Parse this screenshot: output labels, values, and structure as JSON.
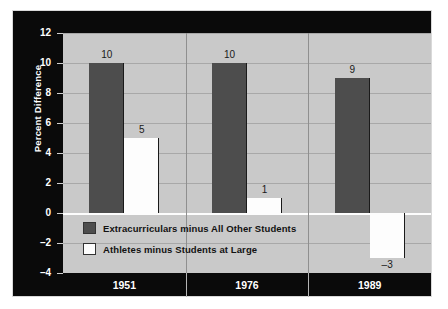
{
  "chart_data": {
    "type": "bar",
    "title": "",
    "subtitle": "",
    "xlabel": "",
    "ylabel": "Percent Difference",
    "ylim": [
      -4,
      12
    ],
    "yticks": [
      "12",
      "10",
      "8",
      "6",
      "4",
      "2",
      "0",
      "–2",
      "–4"
    ],
    "ytick_values": [
      12,
      10,
      8,
      6,
      4,
      2,
      0,
      -2,
      -4
    ],
    "grid": true,
    "legend_position": "inside-lower-left",
    "categories": [
      "1951",
      "1976",
      "1989"
    ],
    "series": [
      {
        "name": "Extracurriculars minus All Other Students",
        "color": "#4d4d4d",
        "values": [
          10,
          10,
          9
        ],
        "labels": [
          "10",
          "10",
          "9"
        ]
      },
      {
        "name": "Athletes minus Students at Large",
        "color": "#fdfdfd",
        "values": [
          5,
          1,
          -3
        ],
        "labels": [
          "5",
          "1",
          "–3"
        ]
      }
    ]
  },
  "axis": {
    "y_title": "Percent Difference",
    "y_ticks": [
      {
        "label": "12",
        "value": 12
      },
      {
        "label": "10",
        "value": 10
      },
      {
        "label": "8",
        "value": 8
      },
      {
        "label": "6",
        "value": 6
      },
      {
        "label": "4",
        "value": 4
      },
      {
        "label": "2",
        "value": 2
      },
      {
        "label": "0",
        "value": 0
      },
      {
        "label": "–2",
        "value": -2
      },
      {
        "label": "–4",
        "value": -4
      }
    ],
    "x_ticks": [
      {
        "label": "1951"
      },
      {
        "label": "1976"
      },
      {
        "label": "1989"
      }
    ]
  },
  "legend": {
    "items": [
      {
        "label": "Extracurriculars minus All Other Students",
        "swatch": "dark"
      },
      {
        "label": "Athletes minus Students at Large",
        "swatch": "light"
      }
    ]
  },
  "bar_labels": {
    "g1s1": "10",
    "g1s2": "5",
    "g2s1": "10",
    "g2s2": "1",
    "g3s1": "9",
    "g3s2": "–3"
  },
  "colors": {
    "panel_background": "#0a0a0a",
    "plot_background": "#c9c9c9",
    "gridline": "#a8a8a8",
    "zero_line": "#fdfdfd",
    "series_dark": "#4d4d4d",
    "series_light": "#fdfdfd",
    "axis_text": "#ffffff",
    "value_text": "#1a1a1a"
  }
}
